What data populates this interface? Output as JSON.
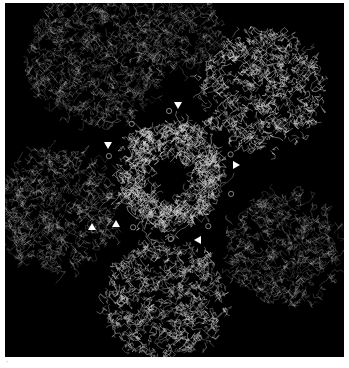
{
  "figure": {
    "background_color": "#000000",
    "border_color": "#ffffff",
    "trace_color": "#d9d9d9",
    "marker_color": "#ffffff",
    "panel_label": "·",
    "core": {
      "center": [
        170,
        175
      ],
      "outer_radius": 52,
      "inner_radius": 13
    },
    "lobes": [
      {
        "name": "top-right",
        "center": [
          262,
          90
        ],
        "radius": 62,
        "brightness": 0.95
      },
      {
        "name": "top-left",
        "center": [
          95,
          55
        ],
        "radius": 70,
        "brightness": 0.45
      },
      {
        "name": "left",
        "center": [
          55,
          210
        ],
        "radius": 62,
        "brightness": 0.5
      },
      {
        "name": "bottom",
        "center": [
          165,
          300
        ],
        "radius": 62,
        "brightness": 0.85
      },
      {
        "name": "bottom-right",
        "center": [
          285,
          250
        ],
        "radius": 58,
        "brightness": 0.45
      },
      {
        "name": "top",
        "center": [
          180,
          30
        ],
        "radius": 40,
        "brightness": 0.4
      }
    ],
    "markers": [
      {
        "name": "arrowhead-1",
        "x": 178,
        "y": 105,
        "direction": "down"
      },
      {
        "name": "arrowhead-2",
        "x": 108,
        "y": 145,
        "direction": "down"
      },
      {
        "name": "arrowhead-3",
        "x": 236,
        "y": 165,
        "direction": "right"
      },
      {
        "name": "arrowhead-4",
        "x": 116,
        "y": 224,
        "direction": "up"
      },
      {
        "name": "arrowhead-5",
        "x": 198,
        "y": 240,
        "direction": "left"
      },
      {
        "name": "arrowhead-6",
        "x": 92,
        "y": 227,
        "direction": "up"
      }
    ]
  }
}
